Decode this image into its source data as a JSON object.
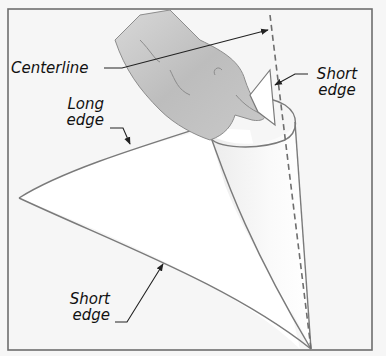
{
  "diagram": {
    "labels": {
      "centerline": "Centerline",
      "long_edge_line1": "Long",
      "long_edge_line2": "edge",
      "short_edge_top_line1": "Short",
      "short_edge_top_line2": "edge",
      "short_edge_bottom_line1": "Short",
      "short_edge_bottom_line2": "edge"
    },
    "colors": {
      "background": "#f6f6f6",
      "frame": "#6e6e6e",
      "outline": "#7a7a7a",
      "paper": "#ffffff",
      "hand": "#c4c4c4",
      "leader": "#222222"
    }
  }
}
